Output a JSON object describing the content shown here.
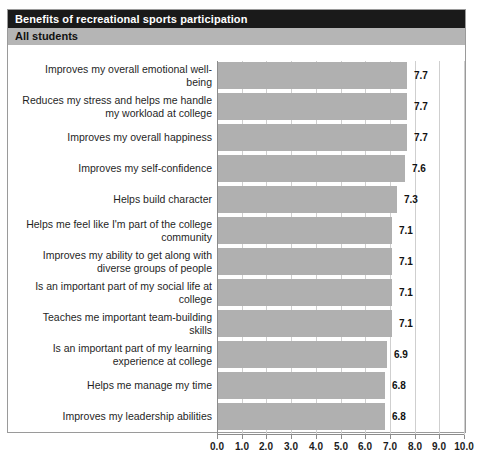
{
  "header": {
    "title": "Benefits of recreational sports participation",
    "subtitle": "All students"
  },
  "chart_data": {
    "type": "bar",
    "orientation": "horizontal",
    "title": "Benefits of recreational sports participation",
    "subtitle": "All students",
    "xlabel": "",
    "ylabel": "",
    "xlim": [
      0.0,
      10.0
    ],
    "grid": true,
    "legend": "none",
    "xticks": [
      "0.0",
      "1.0",
      "2.0",
      "3.0",
      "4.0",
      "5.0",
      "6.0",
      "7.0",
      "8.0",
      "9.0",
      "10.0"
    ],
    "xtick_values": [
      0,
      1,
      2,
      3,
      4,
      5,
      6,
      7,
      8,
      9,
      10
    ],
    "bar_color": "#b0b0b0",
    "categories": [
      "Improves my overall emotional well-being",
      "Reduces my stress and helps me handle my workload at college",
      "Improves my overall happiness",
      "Improves my self-confidence",
      "Helps build character",
      "Helps me feel like I'm part of the college community",
      "Improves my ability to get along with diverse groups of people",
      "Is an important part of my social life at college",
      "Teaches me important team-building skills",
      "Is an important part of my learning experience at college",
      "Helps me manage my time",
      "Improves my leadership abilities"
    ],
    "values": [
      7.7,
      7.7,
      7.7,
      7.6,
      7.3,
      7.1,
      7.1,
      7.1,
      7.1,
      6.9,
      6.8,
      6.8
    ],
    "value_labels": [
      "7.7",
      "7.7",
      "7.7",
      "7.6",
      "7.3",
      "7.1",
      "7.1",
      "7.1",
      "7.1",
      "6.9",
      "6.8",
      "6.8"
    ]
  }
}
